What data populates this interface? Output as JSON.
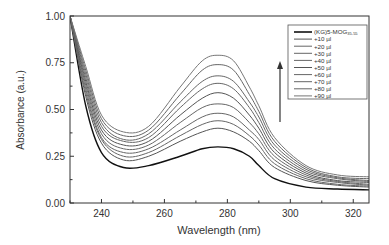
{
  "chart_data": {
    "type": "line",
    "title": "",
    "xlabel": "Wavelength (nm)",
    "ylabel": "Absorbance (a.u.)",
    "xlim": [
      230,
      325
    ],
    "ylim": [
      0.0,
      1.0
    ],
    "xticks": [
      240,
      260,
      280,
      300,
      320
    ],
    "yticks": [
      "0.00",
      "0.25",
      "0.50",
      "0.75",
      "1.00"
    ],
    "grid": false,
    "legend_position": "upper right",
    "annotation": "upward arrow indicating increasing absorbance with titration",
    "x": [
      230,
      235,
      240,
      247,
      255,
      265,
      272,
      277,
      282,
      287,
      290,
      295,
      305,
      315,
      325
    ],
    "series": [
      {
        "name": "(KG)5-MOG35-55",
        "color": "#111111",
        "values": [
          1.0,
          0.52,
          0.27,
          0.19,
          0.2,
          0.25,
          0.29,
          0.3,
          0.29,
          0.25,
          0.2,
          0.13,
          0.085,
          0.075,
          0.07
        ]
      },
      {
        "name": "+10 µl",
        "color": "#555555",
        "values": [
          1.0,
          0.57,
          0.32,
          0.23,
          0.25,
          0.33,
          0.38,
          0.4,
          0.38,
          0.33,
          0.28,
          0.19,
          0.12,
          0.095,
          0.085
        ]
      },
      {
        "name": "+20 µl",
        "color": "#666666",
        "values": [
          1.0,
          0.59,
          0.34,
          0.25,
          0.27,
          0.36,
          0.42,
          0.44,
          0.42,
          0.36,
          0.31,
          0.21,
          0.13,
          0.1,
          0.09
        ]
      },
      {
        "name": "+30 µl",
        "color": "#666666",
        "values": [
          1.0,
          0.61,
          0.35,
          0.27,
          0.29,
          0.39,
          0.46,
          0.48,
          0.46,
          0.39,
          0.34,
          0.23,
          0.14,
          0.11,
          0.095
        ]
      },
      {
        "name": "+40 µl",
        "color": "#666666",
        "values": [
          1.0,
          0.63,
          0.37,
          0.29,
          0.31,
          0.43,
          0.51,
          0.53,
          0.51,
          0.43,
          0.37,
          0.25,
          0.15,
          0.115,
          0.1
        ]
      },
      {
        "name": "+50 µl",
        "color": "#555555",
        "values": [
          1.0,
          0.65,
          0.39,
          0.31,
          0.33,
          0.47,
          0.56,
          0.59,
          0.56,
          0.47,
          0.4,
          0.27,
          0.16,
          0.12,
          0.11
        ]
      },
      {
        "name": "+60 µl",
        "color": "#666666",
        "values": [
          1.0,
          0.67,
          0.41,
          0.33,
          0.35,
          0.51,
          0.61,
          0.64,
          0.61,
          0.51,
          0.43,
          0.29,
          0.17,
          0.13,
          0.115
        ]
      },
      {
        "name": "+70 µl",
        "color": "#666666",
        "values": [
          1.0,
          0.69,
          0.43,
          0.34,
          0.37,
          0.54,
          0.65,
          0.68,
          0.65,
          0.54,
          0.46,
          0.31,
          0.18,
          0.135,
          0.12
        ]
      },
      {
        "name": "+80 µl",
        "color": "#666666",
        "values": [
          1.0,
          0.71,
          0.45,
          0.36,
          0.39,
          0.58,
          0.71,
          0.74,
          0.71,
          0.58,
          0.49,
          0.33,
          0.19,
          0.14,
          0.13
        ]
      },
      {
        "name": "+90 µl",
        "color": "#777777",
        "values": [
          1.0,
          0.73,
          0.47,
          0.38,
          0.41,
          0.62,
          0.76,
          0.79,
          0.76,
          0.62,
          0.52,
          0.35,
          0.2,
          0.15,
          0.14
        ]
      }
    ]
  },
  "axes": {
    "xlabel": "Wavelength (nm)",
    "ylabel": "Absorbance (a.u.)"
  },
  "legend": {
    "items": [
      {
        "main": "(KG)5-MOG",
        "sub": "35-55"
      },
      {
        "main": "+10 µl"
      },
      {
        "main": "+20 µl"
      },
      {
        "main": "+30 µl"
      },
      {
        "main": "+40 µl"
      },
      {
        "main": "+50 µl"
      },
      {
        "main": "+60 µl"
      },
      {
        "main": "+70 µl"
      },
      {
        "main": "+80 µl"
      },
      {
        "main": "+90 µl"
      }
    ]
  }
}
